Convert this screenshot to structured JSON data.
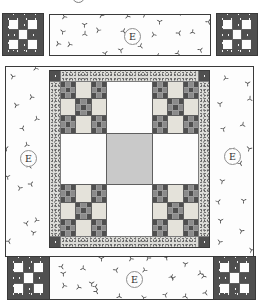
{
  "diagram": {
    "type": "quilt-assembly-diagram",
    "border_fabric_label": "E"
  },
  "labels": {
    "top_border": "E",
    "left_border": "E",
    "right_border": "E",
    "bottom_border": "E"
  },
  "colors": {
    "outline": "#3a3a3a",
    "dark_fabric": "#4f4f4f",
    "dark_fabric_dot": "#f2f2f2",
    "medium_fabric": "#8b8b8b",
    "light_patch": "#e4e2da",
    "white_patch": "#fdfdfd",
    "center_square": "#c9c9c9",
    "stipple_base": "#dcdcd8",
    "stipple_dot": "#707070",
    "grid_line": "#5f5f5f",
    "print_motif": "#4a4a4a"
  },
  "patterns": {
    "corner_block": {
      "grid": [
        [
          "W",
          "D",
          "W"
        ],
        [
          "D",
          "W",
          "D"
        ],
        [
          "W",
          "D",
          "W"
        ]
      ]
    },
    "medallion_center": {
      "grid": [
        [
          "P",
          "W",
          "P"
        ],
        [
          "W",
          "G",
          "W"
        ],
        [
          "P",
          "W",
          "P"
        ]
      ]
    },
    "double_nine_patch": {
      "grid": [
        [
          "N",
          "L",
          "N"
        ],
        [
          "L",
          "N",
          "L"
        ],
        [
          "N",
          "L",
          "N"
        ]
      ]
    },
    "small_nine_patch": {
      "grid": [
        [
          "D",
          "M",
          "D"
        ],
        [
          "M",
          "D",
          "M"
        ],
        [
          "D",
          "M",
          "D"
        ]
      ]
    }
  },
  "cell_styles": {
    "W": {
      "class": "c-white",
      "name": "white-square"
    },
    "D": {
      "class": "tex-dark",
      "name": "dark-print-square"
    },
    "L": {
      "class": "c-light",
      "name": "light-square"
    },
    "M": {
      "class": "c-medium",
      "name": "medium-square"
    },
    "G": {
      "class": "c-gray",
      "name": "center-square"
    },
    "N": {
      "class": "np-lines",
      "name": "small-nine-patch",
      "block": "small_nine_patch"
    },
    "P": {
      "class": "",
      "name": "double-nine-patch-block",
      "block": "double_nine_patch"
    }
  },
  "scatter": {
    "horizontal": {
      "cols": 8,
      "rows": 3
    },
    "vertical": {
      "cols": 2,
      "rows": 8
    }
  }
}
